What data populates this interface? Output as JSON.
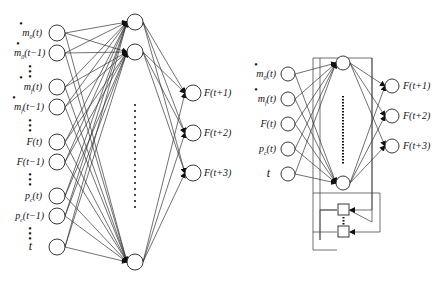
{
  "left_network": {
    "inputs": [
      {
        "label": "ṁ₀(t)",
        "y": 33
      },
      {
        "label": "ṁ₀(t−1)",
        "y": 53
      },
      {
        "label": "ṁ_f(t)",
        "y": 87
      },
      {
        "label": "ṁ_f(t−1)",
        "y": 107
      },
      {
        "label": "F(t)",
        "y": 142
      },
      {
        "label": "F(t−1)",
        "y": 162
      },
      {
        "label": "p_c(t)",
        "y": 196
      },
      {
        "label": "p_c(t−1)",
        "y": 216
      },
      {
        "label": "t",
        "y": 247
      }
    ],
    "hidden_y": [
      22,
      52,
      262
    ],
    "outputs": [
      {
        "label": "F(t+1)",
        "y": 93
      },
      {
        "label": "F(t+2)",
        "y": 133
      },
      {
        "label": "F(t+3)",
        "y": 173
      }
    ]
  },
  "right_network": {
    "inputs": [
      {
        "label": "ṁ₀(t)",
        "y": 74
      },
      {
        "label": "ṁ_f(t)",
        "y": 99
      },
      {
        "label": "F(t)",
        "y": 124
      },
      {
        "label": "p_c(t)",
        "y": 149
      },
      {
        "label": "t",
        "y": 174
      }
    ],
    "hidden_y": [
      63,
      183
    ],
    "outputs": [
      {
        "label": "F(t+1)",
        "y": 86
      },
      {
        "label": "F(t+2)",
        "y": 116
      },
      {
        "label": "F(t+3)",
        "y": 146
      }
    ],
    "delay_boxes": 2
  },
  "labels": {
    "l_in0_main": "m",
    "l_in0_sub": "0",
    "l_in0_arg": "(t)",
    "l_in1_main": "m",
    "l_in1_sub": "0",
    "l_in1_arg": "(t−1)",
    "l_in2_main": "m",
    "l_in2_sub": "f",
    "l_in2_arg": "(t)",
    "l_in3_main": "m",
    "l_in3_sub": "f",
    "l_in3_arg": "(t−1)",
    "l_in4": "F(t)",
    "l_in5": "F(t−1)",
    "l_in6_main": "p",
    "l_in6_sub": "c",
    "l_in6_arg": "(t)",
    "l_in7_main": "p",
    "l_in7_sub": "c",
    "l_in7_arg": "(t−1)",
    "l_in8": "t",
    "l_out0": "F(t+1)",
    "l_out1": "F(t+2)",
    "l_out2": "F(t+3)",
    "r_in0_main": "m",
    "r_in0_sub": "0",
    "r_in0_arg": "(t)",
    "r_in1_main": "m",
    "r_in1_sub": "f",
    "r_in1_arg": "(t)",
    "r_in2": "F(t)",
    "r_in3_main": "p",
    "r_in3_sub": "c",
    "r_in3_arg": "(t)",
    "r_in4": "t",
    "r_out0": "F(t+1)",
    "r_out1": "F(t+2)",
    "r_out2": "F(t+3)",
    "dot": "•"
  }
}
